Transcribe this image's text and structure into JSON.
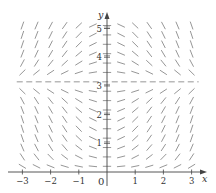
{
  "figure": {
    "type": "slope-field",
    "equation": "dy/dx = x sin y",
    "x_axis": {
      "label": "x",
      "range": [
        -3,
        3
      ],
      "ticks": [
        {
          "value": -3,
          "label": "−3"
        },
        {
          "value": -2,
          "label": "−2"
        },
        {
          "value": -1,
          "label": "−1"
        },
        {
          "value": 1,
          "label": "1"
        },
        {
          "value": 2,
          "label": "2"
        },
        {
          "value": 3,
          "label": "3"
        }
      ]
    },
    "y_axis": {
      "label": "y",
      "range": [
        0,
        5.3
      ],
      "ticks": [
        {
          "value": 1,
          "label": "1"
        },
        {
          "value": 2,
          "label": "2"
        },
        {
          "value": 3,
          "label": "3"
        },
        {
          "value": 4,
          "label": "4"
        },
        {
          "value": 5,
          "label": "5"
        }
      ]
    },
    "origin_label": "0",
    "equilibrium_line": {
      "y": 3.14159,
      "style": "dashed"
    },
    "grid": {
      "x_start": -3,
      "x_end": 3,
      "x_step": 0.5,
      "y_center": 3.14159,
      "y_step": 0.327,
      "y_steps_below": 9,
      "y_steps_above": 6
    },
    "colors": {
      "axis": "#444444",
      "segment": "#8a8a8a",
      "text": "#333333"
    }
  },
  "layout": {
    "origin_px": [
      107,
      172
    ],
    "unit_x_px": 28.2,
    "unit_y_px": 28.7,
    "segment_len_px": 7.5
  }
}
